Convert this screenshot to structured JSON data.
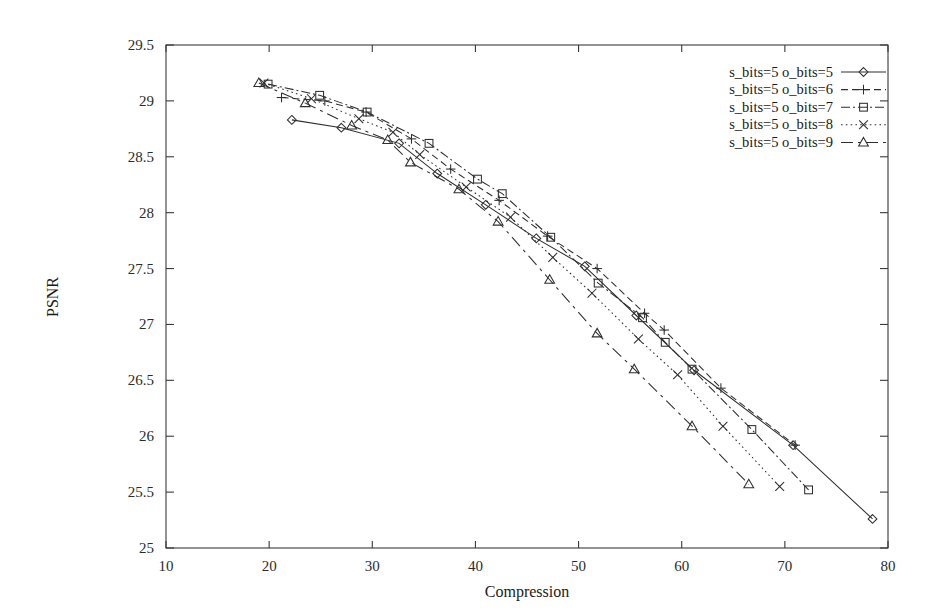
{
  "chart_data": {
    "type": "line",
    "title": "",
    "xlabel": "Compression",
    "ylabel": "PSNR",
    "xlim": [
      10,
      80
    ],
    "ylim": [
      25,
      29.5
    ],
    "xticks": [
      10,
      20,
      30,
      40,
      50,
      60,
      70,
      80
    ],
    "yticks": [
      25,
      25.5,
      26,
      26.5,
      27,
      27.5,
      28,
      28.5,
      29,
      29.5
    ],
    "xtick_labels": [
      "10",
      "20",
      "30",
      "40",
      "50",
      "60",
      "70",
      "80"
    ],
    "ytick_labels": [
      "25",
      "25.5",
      "26",
      "26.5",
      "27",
      "27.5",
      "28",
      "28.5",
      "29",
      "29.5"
    ],
    "grid": false,
    "legend_position": "top-right",
    "series": [
      {
        "name": "s_bits=5 o_bits=5",
        "marker": "diamond",
        "linestyle": "solid",
        "points": [
          [
            22.2,
            28.83
          ],
          [
            27.0,
            28.76
          ],
          [
            32.6,
            28.62
          ],
          [
            36.3,
            28.35
          ],
          [
            41.0,
            28.07
          ],
          [
            45.9,
            27.77
          ],
          [
            50.6,
            27.52
          ],
          [
            55.6,
            27.08
          ],
          [
            61.2,
            26.59
          ],
          [
            70.8,
            25.92
          ],
          [
            78.5,
            25.26
          ]
        ]
      },
      {
        "name": "s_bits=5 o_bits=6",
        "marker": "plus",
        "linestyle": "dashed",
        "points": [
          [
            21.2,
            29.03
          ],
          [
            25.4,
            29.0
          ],
          [
            29.4,
            28.9
          ],
          [
            33.8,
            28.66
          ],
          [
            37.6,
            28.39
          ],
          [
            42.3,
            28.11
          ],
          [
            47.0,
            27.79
          ],
          [
            51.8,
            27.5
          ],
          [
            56.4,
            27.1
          ],
          [
            58.3,
            26.95
          ],
          [
            63.8,
            26.43
          ],
          [
            71.0,
            25.92
          ]
        ]
      },
      {
        "name": "s_bits=5 o_bits=7",
        "marker": "square",
        "linestyle": "dashdot",
        "points": [
          [
            19.9,
            29.15
          ],
          [
            24.9,
            29.05
          ],
          [
            29.5,
            28.9
          ],
          [
            35.5,
            28.62
          ],
          [
            40.2,
            28.3
          ],
          [
            42.6,
            28.17
          ],
          [
            47.3,
            27.78
          ],
          [
            51.9,
            27.37
          ],
          [
            56.2,
            27.06
          ],
          [
            58.4,
            26.84
          ],
          [
            61.0,
            26.6
          ],
          [
            66.8,
            26.06
          ],
          [
            72.3,
            25.52
          ]
        ]
      },
      {
        "name": "s_bits=5 o_bits=8",
        "marker": "cross",
        "linestyle": "dotted",
        "points": [
          [
            19.5,
            29.16
          ],
          [
            24.1,
            29.02
          ],
          [
            28.7,
            28.84
          ],
          [
            32.0,
            28.72
          ],
          [
            34.6,
            28.52
          ],
          [
            39.1,
            28.23
          ],
          [
            43.4,
            27.96
          ],
          [
            47.5,
            27.6
          ],
          [
            51.3,
            27.28
          ],
          [
            55.8,
            26.87
          ],
          [
            59.6,
            26.55
          ],
          [
            64.0,
            26.09
          ],
          [
            69.5,
            25.55
          ]
        ]
      },
      {
        "name": "s_bits=5 o_bits=9",
        "marker": "triangle",
        "linestyle": "longdash",
        "points": [
          [
            19.0,
            29.16
          ],
          [
            23.5,
            28.98
          ],
          [
            28.0,
            28.78
          ],
          [
            31.5,
            28.65
          ],
          [
            33.7,
            28.45
          ],
          [
            38.4,
            28.21
          ],
          [
            42.2,
            27.92
          ],
          [
            47.2,
            27.4
          ],
          [
            51.8,
            26.92
          ],
          [
            55.4,
            26.6
          ],
          [
            61.0,
            26.09
          ],
          [
            66.5,
            25.57
          ]
        ]
      }
    ]
  },
  "legend": {
    "entries": [
      {
        "label": "s_bits=5 o_bits=5"
      },
      {
        "label": "s_bits=5 o_bits=6"
      },
      {
        "label": "s_bits=5 o_bits=7"
      },
      {
        "label": "s_bits=5 o_bits=8"
      },
      {
        "label": "s_bits=5 o_bits=9"
      }
    ]
  }
}
